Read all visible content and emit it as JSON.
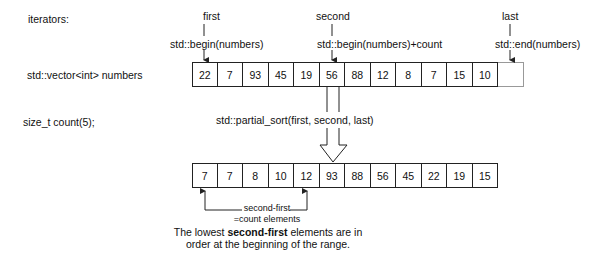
{
  "labels": {
    "iterators": "iterators:",
    "vector_decl": "std::vector<int> numbers",
    "count_decl": "size_t count(5);",
    "first": "first",
    "first_expr": "std::begin(numbers)",
    "second": "second",
    "second_expr": "std::begin(numbers)+count",
    "last": "last",
    "last_expr": "std::end(numbers)",
    "call": "std::partial_sort(first, second, last)",
    "span_line1": "second-first",
    "span_line2": "=count elements",
    "caption_pre": "The lowest ",
    "caption_bold": "second-first",
    "caption_post": " elements are in",
    "caption_line2": "order at the beginning of the range."
  },
  "before": [
    "22",
    "7",
    "93",
    "45",
    "19",
    "56",
    "88",
    "12",
    "8",
    "7",
    "15",
    "10"
  ],
  "after": [
    "7",
    "7",
    "8",
    "10",
    "12",
    "93",
    "88",
    "56",
    "45",
    "22",
    "19",
    "15"
  ]
}
